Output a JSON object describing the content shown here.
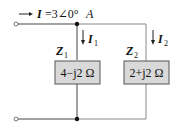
{
  "diagram": {
    "type": "parallel-ac-circuit",
    "source_current": {
      "symbol": "I",
      "equals": "=3∠0°",
      "unit": "A",
      "full_text": "I=3∠0° A"
    },
    "branches": [
      {
        "impedance_label": "Z",
        "impedance_sub": "1",
        "current_label": "I",
        "current_sub": "1",
        "value": "4−j2 Ω"
      },
      {
        "impedance_label": "Z",
        "impedance_sub": "2",
        "current_label": "I",
        "current_sub": "2",
        "value": "2+j2 Ω"
      }
    ],
    "colors": {
      "wire": "#444444",
      "impedance_fill": "#d9d9d9",
      "impedance_border": "#555555"
    }
  }
}
